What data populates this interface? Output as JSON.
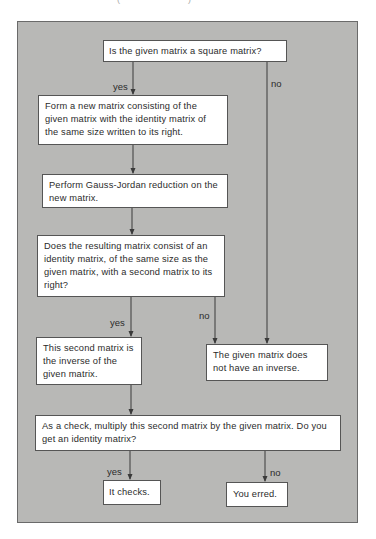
{
  "header_fragment": {
    "left": "(",
    "right": ")"
  },
  "flowchart": {
    "background_color": "#b8b8b6",
    "box_color": "#ffffff",
    "line_color": "#3a3a3a",
    "nodes": {
      "q_square": "Is the given matrix a square matrix?",
      "form_matrix": "Form a new matrix consisting of the given matrix with the identity matrix of the same size written to its right.",
      "gauss_jordan": "Perform Gauss-Jordan reduction on the new matrix.",
      "q_identity": "Does the resulting matrix consist of an identity matrix, of the same size as the given matrix, with a second matrix to its right?",
      "is_inverse": "This second matrix is the inverse of the given matrix.",
      "no_inverse": "The given matrix does not have an inverse.",
      "q_check": "As a check, multiply this second matrix by the given matrix. Do you get an identity matrix?",
      "it_checks": "It checks.",
      "you_erred": "You erred."
    },
    "edge_labels": {
      "square_yes": "yes",
      "square_no": "no",
      "identity_yes": "yes",
      "identity_no": "no",
      "check_yes": "yes",
      "check_no": "no"
    }
  }
}
